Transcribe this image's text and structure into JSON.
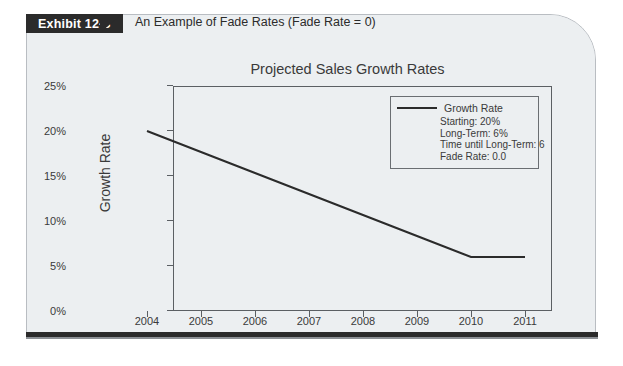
{
  "exhibit": {
    "tab_label": "Exhibit 12-3",
    "title": "An Example of Fade Rates (Fade Rate = 0)"
  },
  "chart_data": {
    "type": "line",
    "title": "Projected Sales Growth Rates",
    "xlabel": "Year",
    "ylabel": "Growth Rate",
    "x": [
      2004,
      2005,
      2006,
      2007,
      2008,
      2009,
      2010,
      2011
    ],
    "xtick_labels": [
      "2004",
      "2005",
      "2006",
      "2007",
      "2008",
      "2009",
      "2010",
      "2011"
    ],
    "ytick_labels": [
      "0%",
      "5%",
      "10%",
      "15%",
      "20%",
      "25%"
    ],
    "ytick_values": [
      0,
      5,
      10,
      15,
      20,
      25
    ],
    "ylim": [
      0,
      25
    ],
    "xlim": [
      2004,
      2011
    ],
    "grid": false,
    "legend_position": "upper right",
    "series": [
      {
        "name": "Growth Rate",
        "color": "#2b2b2b",
        "values": [
          20,
          17.67,
          15.33,
          13,
          10.67,
          8.33,
          6,
          6
        ]
      }
    ],
    "annotations": {
      "starting": "Starting:  20%",
      "long_term": "Long-Term:  6%",
      "time_until_long_term": "Time until Long-Term: 6",
      "fade_rate": "Fade Rate:  0.0"
    }
  },
  "colors": {
    "band": "#9a9ea3",
    "panel": "#eceff1",
    "tab": "#2b2b2b",
    "line": "#2b2b2b",
    "axis": "#5b5f63"
  }
}
